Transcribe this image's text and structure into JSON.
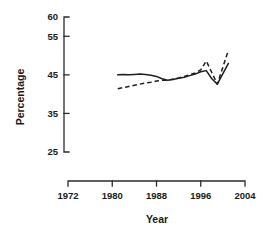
{
  "chart_data": {
    "type": "line",
    "title": "",
    "xlabel": "Year",
    "ylabel": "Percentage",
    "xlim": [
      1972,
      2004
    ],
    "ylim": [
      25,
      60
    ],
    "grid": false,
    "legend": "none",
    "xticks": [
      1972,
      1980,
      1988,
      1996,
      2004
    ],
    "xtick_labels": [
      "1972",
      "1980",
      "1988",
      "1996",
      "2004"
    ],
    "yticks": [
      25,
      35,
      45,
      55,
      60
    ],
    "ytick_labels": [
      "25",
      "35",
      "45",
      "55",
      "60"
    ],
    "series": [
      {
        "name": "solid-series",
        "style": "solid",
        "color": "#1f1f1f",
        "x": [
          1981,
          1982,
          1983,
          1984,
          1985,
          1986,
          1987,
          1988,
          1989,
          1990,
          1991,
          1992,
          1993,
          1994,
          1995,
          1996,
          1997,
          1998,
          1999,
          2000,
          2001
        ],
        "values": [
          45.0,
          45.1,
          45.0,
          45.1,
          45.2,
          45.1,
          44.9,
          44.6,
          44.0,
          43.6,
          43.8,
          44.1,
          44.4,
          44.8,
          45.2,
          45.8,
          46.1,
          44.0,
          42.6,
          45.3,
          48.0
        ]
      },
      {
        "name": "dashed-series",
        "style": "dashed",
        "color": "#1f1f1f",
        "x": [
          1981,
          1982,
          1983,
          1984,
          1985,
          1986,
          1987,
          1988,
          1989,
          1990,
          1991,
          1992,
          1993,
          1994,
          1995,
          1996,
          1997,
          1998,
          1999,
          2000,
          2001
        ],
        "values": [
          41.4,
          41.7,
          42.0,
          42.3,
          42.6,
          42.9,
          43.1,
          43.4,
          43.6,
          43.6,
          43.9,
          44.2,
          44.6,
          45.0,
          45.5,
          46.3,
          48.6,
          45.6,
          42.6,
          47.0,
          51.4
        ]
      }
    ]
  }
}
